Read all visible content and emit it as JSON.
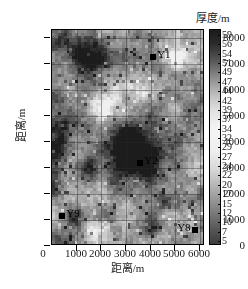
{
  "chart_data": {
    "type": "heatmap",
    "title": "",
    "xlabel": "距离/m",
    "ylabel": "距离/m",
    "colorbar_title": "厚度/m",
    "xlim": [
      0,
      6200
    ],
    "ylim": [
      0,
      8300
    ],
    "xticks": [
      0,
      1000,
      2000,
      3000,
      4000,
      5000,
      6000
    ],
    "yticks": [
      0,
      1000,
      2000,
      3000,
      4000,
      5000,
      6000,
      7000,
      8000
    ],
    "xtick_labels": [
      "0",
      "1000",
      "2000",
      "3000",
      "4000",
      "5000",
      "6000"
    ],
    "ytick_labels": [
      "0",
      "1000",
      "2000",
      "3000",
      "4000",
      "5000",
      "6000",
      "7000",
      "8000"
    ],
    "grid": true,
    "colormap": "gray",
    "zlim": [
      5,
      59
    ],
    "colorbar_ticks": [
      59,
      56,
      54,
      51,
      49,
      47,
      44,
      42,
      39,
      37,
      34,
      32,
      29,
      27,
      24,
      22,
      20,
      17,
      15,
      12,
      10,
      7,
      5
    ],
    "colorbar_tick_labels": [
      "59",
      "56",
      "54",
      "51",
      "49",
      "47",
      "44",
      "42",
      "39",
      "37",
      "34",
      "32",
      "29",
      "27",
      "24",
      "22",
      "20",
      "17",
      "15",
      "12",
      "10",
      "7",
      "5"
    ],
    "annotations": [
      {
        "label": "Y1",
        "x": 4100,
        "y": 7250,
        "label_side": "right"
      },
      {
        "label": "Y2",
        "x": 3580,
        "y": 3180,
        "label_side": "right"
      },
      {
        "label": "Y9",
        "x": 420,
        "y": 1140,
        "label_side": "right"
      },
      {
        "label": "Y8",
        "x": 5780,
        "y": 620,
        "label_side": "left"
      }
    ],
    "series": [
      {
        "name": "thickness-field",
        "description": "Grayscale thickness map; dark regions indicate high thickness values near 59 m and bright regions indicate low thickness near 5 m.",
        "nx": 52,
        "ny": 73,
        "value_range": [
          5,
          59
        ]
      }
    ]
  },
  "colors": {
    "background": "#ffffff",
    "axis": "#000000",
    "grid": "#282828",
    "marker": "#000000",
    "colorbar_high": "#1a1a1a",
    "colorbar_low": "#3a3a3a",
    "colorbar_mid": "#f2f2f2"
  }
}
